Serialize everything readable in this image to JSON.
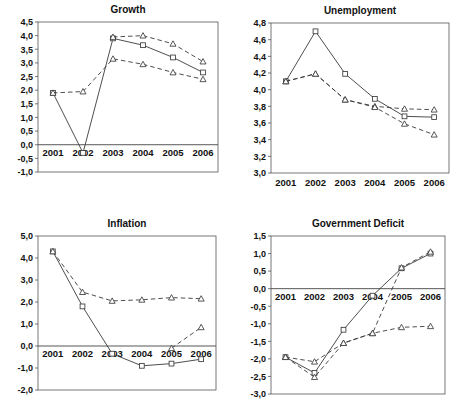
{
  "figure": {
    "name": "four-panel-macroeconomic-forecast",
    "panel_count": 4
  },
  "chart_data": [
    {
      "type": "line",
      "title": "Growth",
      "xlabel": "",
      "ylabel": "",
      "categories": [
        "2001",
        "2002",
        "2003",
        "2004",
        "2005",
        "2006"
      ],
      "x": [
        2001,
        2002,
        2003,
        2004,
        2005,
        2006
      ],
      "ylim": [
        -1.0,
        4.5
      ],
      "yticks": [
        -1.0,
        -0.5,
        0.0,
        0.5,
        1.0,
        1.5,
        2.0,
        2.5,
        3.0,
        3.5,
        4.0,
        4.5
      ],
      "ytick_labels": [
        "-1,0",
        "-0,5",
        "0,0",
        "0,5",
        "1,0",
        "1,5",
        "2,0",
        "2,5",
        "3,0",
        "3,5",
        "4,0",
        "4,5"
      ],
      "grid": false,
      "legend": "none",
      "series": [
        {
          "name": "series-solid-square",
          "marker": "square",
          "line": "solid",
          "values": [
            1.9,
            -0.3,
            3.9,
            3.65,
            3.2,
            2.65
          ]
        },
        {
          "name": "series-dashed-triangle-upper",
          "marker": "triangle",
          "line": "dashed",
          "values": [
            null,
            null,
            3.95,
            4.0,
            3.7,
            3.05
          ]
        },
        {
          "name": "series-dashed-triangle-lower",
          "marker": "triangle",
          "line": "dashed",
          "values": [
            1.9,
            1.95,
            3.15,
            2.95,
            2.65,
            2.4
          ]
        }
      ]
    },
    {
      "type": "line",
      "title": "Unemployment",
      "xlabel": "",
      "ylabel": "",
      "categories": [
        "2001",
        "2002",
        "2003",
        "2004",
        "2005",
        "2006"
      ],
      "x": [
        2001,
        2002,
        2003,
        2004,
        2005,
        2006
      ],
      "ylim": [
        3.0,
        4.8
      ],
      "yticks": [
        3.0,
        3.2,
        3.4,
        3.6,
        3.8,
        4.0,
        4.2,
        4.4,
        4.6,
        4.8
      ],
      "ytick_labels": [
        "3,0",
        "3,2",
        "3,4",
        "3,6",
        "3,8",
        "4,0",
        "4,2",
        "4,4",
        "4,6",
        "4,8"
      ],
      "grid": false,
      "legend": "none",
      "series": [
        {
          "name": "series-solid-square",
          "marker": "square",
          "line": "solid",
          "values": [
            4.1,
            4.7,
            4.19,
            3.89,
            3.68,
            3.67
          ]
        },
        {
          "name": "series-dashed-triangle-upper",
          "marker": "triangle",
          "line": "dashed",
          "values": [
            4.1,
            4.19,
            3.88,
            3.8,
            3.77,
            3.76
          ]
        },
        {
          "name": "series-dotted-triangle-lower",
          "marker": "triangle",
          "line": "dashed",
          "values": [
            4.1,
            4.19,
            3.88,
            3.79,
            3.59,
            3.46
          ]
        }
      ]
    },
    {
      "type": "line",
      "title": "Inflation",
      "xlabel": "",
      "ylabel": "",
      "categories": [
        "2001",
        "2002",
        "2003",
        "2004",
        "2005",
        "2006"
      ],
      "x": [
        2001,
        2002,
        2003,
        2004,
        2005,
        2006
      ],
      "ylim": [
        -2.0,
        5.0
      ],
      "yticks": [
        -2.0,
        -1.0,
        0.0,
        1.0,
        2.0,
        3.0,
        4.0,
        5.0
      ],
      "ytick_labels": [
        "-2,0",
        "-1,0",
        "0,0",
        "1,0",
        "2,0",
        "3,0",
        "4,0",
        "5,0"
      ],
      "grid": false,
      "legend": "none",
      "series": [
        {
          "name": "series-solid-square",
          "marker": "square",
          "line": "solid",
          "values": [
            4.3,
            1.8,
            -0.35,
            -0.9,
            -0.8,
            -0.6
          ]
        },
        {
          "name": "series-dashed-triangle",
          "marker": "triangle",
          "line": "dashed",
          "values": [
            4.3,
            2.45,
            2.05,
            2.1,
            2.2,
            2.15
          ]
        },
        {
          "name": "series-dashed-triangle-rising",
          "marker": "triangle",
          "line": "dashed",
          "values": [
            null,
            null,
            null,
            null,
            -0.1,
            0.85
          ]
        }
      ]
    },
    {
      "type": "line",
      "title": "Government Deficit",
      "xlabel": "",
      "ylabel": "",
      "categories": [
        "2001",
        "2002",
        "2003",
        "2004",
        "2005",
        "2006"
      ],
      "x": [
        2001,
        2002,
        2003,
        2004,
        2005,
        2006
      ],
      "ylim": [
        -3.0,
        1.5
      ],
      "yticks": [
        -3.0,
        -2.5,
        -2.0,
        -1.5,
        -1.0,
        -0.5,
        0.0,
        0.5,
        1.0,
        1.5
      ],
      "ytick_labels": [
        "-3,0",
        "-2,5",
        "-2,0",
        "-1,5",
        "-1,0",
        "-0,5",
        "0,0",
        "0,5",
        "1,0",
        "1,5"
      ],
      "grid": false,
      "legend": "none",
      "series": [
        {
          "name": "series-solid-square",
          "marker": "square",
          "line": "solid",
          "values": [
            -1.95,
            -2.4,
            -1.17,
            -0.2,
            0.58,
            1.0
          ]
        },
        {
          "name": "series-dashed-triangle-lower",
          "marker": "triangle",
          "line": "dashed",
          "values": [
            -1.95,
            -2.52,
            -1.55,
            -1.27,
            0.6,
            1.05
          ]
        },
        {
          "name": "series-dashed-triangle-flat",
          "marker": "triangle",
          "line": "dashed",
          "values": [
            -1.95,
            -2.08,
            -1.55,
            -1.27,
            -1.1,
            -1.07
          ]
        }
      ]
    }
  ]
}
